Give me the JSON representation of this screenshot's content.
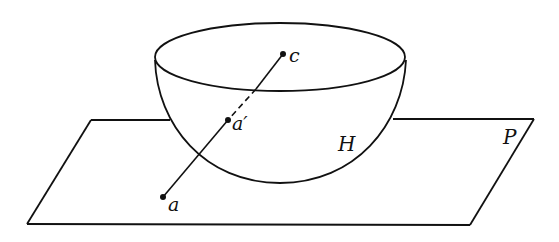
{
  "diagram": {
    "type": "geometry",
    "stroke_color": "#111111",
    "background": "#ffffff",
    "labels": {
      "center": "c",
      "point_a_prime": "a′",
      "point_a": "a",
      "hemisphere": "H",
      "plane": "P"
    },
    "points": {
      "c": [
        283,
        54
      ],
      "a_prime": [
        228,
        120
      ],
      "a": [
        163,
        197
      ]
    }
  }
}
